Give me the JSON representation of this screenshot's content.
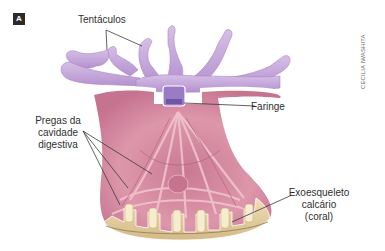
{
  "figure": {
    "panel_label": "A",
    "credit": "CECILIA IWASHITA",
    "colors": {
      "tentacles": "#c7a6db",
      "tentacles_shade": "#a987c4",
      "body_wall": "#d9889f",
      "body_inner": "#e7a5b7",
      "pharynx": "#8a6bb8",
      "skeleton": "#e6d2a3",
      "skeleton_shade": "#c9ad72",
      "outline": "#ffffff",
      "leader_line": "#3a3a3a"
    }
  },
  "labels": {
    "tentacles": "Tentáculos",
    "pharynx": "Faringe",
    "folds_line1": "Pregas da",
    "folds_line2": "cavidade",
    "folds_line3": "digestiva",
    "skeleton_line1": "Exoesqueleto",
    "skeleton_line2": "calcário",
    "skeleton_line3": "(coral)"
  }
}
